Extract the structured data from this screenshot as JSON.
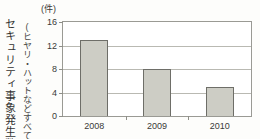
{
  "chart_data": {
    "type": "bar",
    "title": "",
    "subtitle": "",
    "unit_label": "(件)",
    "categories": [
      "2008",
      "2009",
      "2010"
    ],
    "values": [
      13,
      8,
      5
    ],
    "series": [
      {
        "name": "セキュリティ事象発生数",
        "values": [
          13,
          8,
          5
        ]
      }
    ],
    "xlabel": "",
    "ylabel": "セキュリティ事象発生数",
    "ylabel_note": "(ヒヤリ・ハットなどすべて軽度なもの)",
    "ylim": [
      0,
      16
    ],
    "yticks": [
      0,
      4,
      8,
      12,
      16
    ],
    "ytick_labels": [
      "0",
      "4",
      "8",
      "12",
      "16"
    ],
    "grid": true,
    "legend": false,
    "legend_position": "none",
    "bar_fill_color": "#cdcdc5",
    "bar_border_color": "#6e6e68",
    "grid_color": "#b9b9b2",
    "axis_color": "#9a9a94",
    "text_color": "#3a3a38",
    "background_color": "#fdfdfb"
  }
}
